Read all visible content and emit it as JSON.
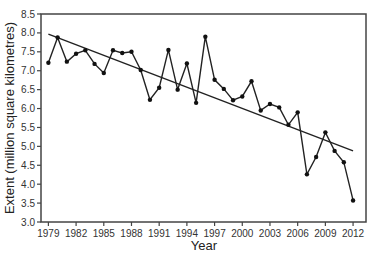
{
  "chart_data": {
    "type": "line",
    "title": "",
    "xlabel": "Year",
    "ylabel": "Extent (million square kilometres)",
    "x": [
      1979,
      1980,
      1981,
      1982,
      1983,
      1984,
      1985,
      1986,
      1987,
      1988,
      1989,
      1990,
      1991,
      1992,
      1993,
      1994,
      1995,
      1996,
      1997,
      1998,
      1999,
      2000,
      2001,
      2002,
      2003,
      2004,
      2005,
      2006,
      2007,
      2008,
      2009,
      2010,
      2011,
      2012
    ],
    "series": [
      {
        "name": "Extent",
        "values": [
          7.21,
          7.88,
          7.24,
          7.45,
          7.54,
          7.18,
          6.94,
          7.54,
          7.47,
          7.5,
          7.02,
          6.23,
          6.55,
          7.55,
          6.5,
          7.19,
          6.15,
          7.9,
          6.76,
          6.52,
          6.22,
          6.32,
          6.72,
          5.95,
          6.12,
          6.03,
          5.57,
          5.9,
          4.26,
          4.72,
          5.37,
          4.88,
          4.58,
          3.57
        ]
      },
      {
        "name": "Linear trend",
        "x": [
          1979,
          2012
        ],
        "values": [
          7.97,
          4.88
        ]
      }
    ],
    "xticks": [
      1979,
      1982,
      1985,
      1988,
      1991,
      1994,
      1997,
      2000,
      2003,
      2006,
      2009,
      2012
    ],
    "yticks": [
      "3.0",
      "3.5",
      "4.0",
      "4.5",
      "5.0",
      "5.5",
      "6.0",
      "6.5",
      "7.0",
      "7.5",
      "8.0",
      "8.5"
    ],
    "xlim": [
      1978.2,
      2013.4
    ],
    "ylim": [
      3.0,
      8.5
    ],
    "grid": false,
    "legend": "none"
  }
}
